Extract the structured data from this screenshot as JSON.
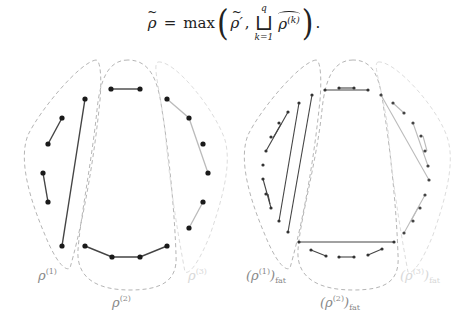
{
  "equation": {
    "lhs": "ρ",
    "equals": "=",
    "max": "max",
    "arg1": "ρ′",
    "comma": ",",
    "operator": "⊔",
    "upper_limit": "q",
    "lower_limit": "k=1",
    "arg2_base": "ρ",
    "arg2_sup": "(k)",
    "period": "."
  },
  "colors": {
    "dot": "#1a1a1a",
    "edge_dark": "#444444",
    "edge_light": "#bbbbbb",
    "outline_1": "#b5b5b5",
    "outline_2": "#b5b5b5",
    "outline_3": "#dddddd",
    "label_1": "#888888",
    "label_2": "#888888",
    "label_3": "#d8d8d8"
  },
  "left_diagram": {
    "labels": [
      {
        "base": "ρ",
        "sup": "(1)",
        "sub": "",
        "x": 40,
        "y": 278
      },
      {
        "base": "ρ",
        "sup": "(2)",
        "sub": "",
        "x": 115,
        "y": 305
      },
      {
        "base": "ρ",
        "sup": "(3)",
        "sub": "",
        "x": 190,
        "y": 278
      }
    ],
    "groups": {
      "rho1": {
        "edges": [
          [
            [
              62,
              118
            ],
            [
              48,
              144
            ]
          ],
          [
            [
              43,
              173
            ],
            [
              48,
              202
            ]
          ],
          [
            [
              85,
              99
            ],
            [
              62,
              246
            ]
          ]
        ],
        "dots": [
          [
            85,
            99
          ],
          [
            62,
            118
          ],
          [
            48,
            144
          ],
          [
            43,
            173
          ],
          [
            48,
            202
          ],
          [
            62,
            246
          ]
        ]
      },
      "rho2": {
        "edges": [
          [
            [
              111,
              89
            ],
            [
              140,
              89
            ]
          ],
          [
            [
              85,
              246
            ],
            [
              112,
              257
            ]
          ],
          [
            [
              112,
              257
            ],
            [
              140,
              257
            ]
          ],
          [
            [
              140,
              257
            ],
            [
              167,
              246
            ]
          ]
        ],
        "dots": [
          [
            111,
            89
          ],
          [
            140,
            89
          ],
          [
            85,
            246
          ],
          [
            112,
            257
          ],
          [
            140,
            257
          ],
          [
            167,
            246
          ]
        ]
      },
      "rho3": {
        "edges": [
          [
            [
              167,
              99
            ],
            [
              189,
              118
            ]
          ],
          [
            [
              189,
              118
            ],
            [
              208,
              173
            ]
          ],
          [
            [
              203,
              202
            ],
            [
              189,
              228
            ]
          ]
        ],
        "dots": [
          [
            167,
            99
          ],
          [
            189,
            118
          ],
          [
            203,
            144
          ],
          [
            208,
            173
          ],
          [
            203,
            202
          ],
          [
            189,
            228
          ]
        ]
      }
    }
  },
  "right_diagram": {
    "labels": [
      {
        "base": "(ρ",
        "sup": "(1)",
        "close": ")",
        "sub": "fat",
        "x": 248,
        "y": 278
      },
      {
        "base": "(ρ",
        "sup": "(2)",
        "close": ")",
        "sub": "fat",
        "x": 325,
        "y": 305
      },
      {
        "base": "(ρ",
        "sup": "(3)",
        "close": ")",
        "sub": "fat",
        "x": 402,
        "y": 278
      }
    ]
  }
}
